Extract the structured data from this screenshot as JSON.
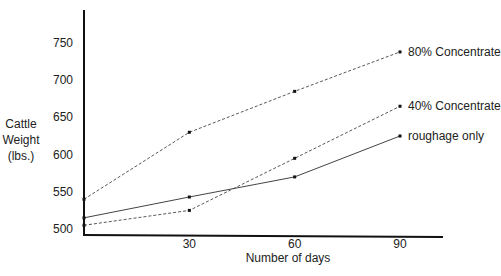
{
  "chart_data": {
    "type": "line",
    "title": "",
    "xlabel": "Number of days",
    "ylabel": [
      "Cattle",
      "Weight",
      "(lbs.)"
    ],
    "x": [
      0,
      30,
      60,
      90
    ],
    "xticks": [
      "30",
      "60",
      "90"
    ],
    "yticks": [
      "500",
      "550",
      "600",
      "650",
      "700",
      "750"
    ],
    "ylim": [
      495,
      800
    ],
    "xlim": [
      0,
      105
    ],
    "grid": false,
    "legend_position": "inline-right",
    "series": [
      {
        "name": "80% Concentrate",
        "style": "dashed",
        "values": [
          540,
          630,
          685,
          738
        ]
      },
      {
        "name": "40% Concentrate",
        "style": "dashed",
        "values": [
          505,
          525,
          595,
          665
        ]
      },
      {
        "name": "roughage only",
        "style": "solid",
        "values": [
          515,
          543,
          570,
          625
        ]
      }
    ]
  }
}
